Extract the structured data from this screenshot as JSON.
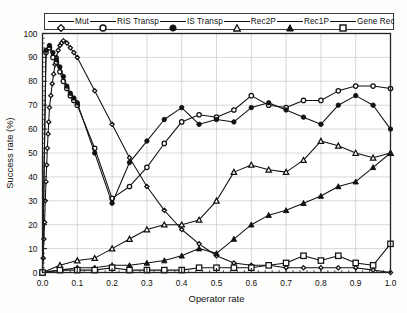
{
  "chart_data": {
    "type": "line",
    "title": "",
    "xlabel": "Operator rate",
    "ylabel": "Success rate (%)",
    "xlim": [
      0.0,
      1.0
    ],
    "ylim": [
      0,
      100
    ],
    "grid": true,
    "legend_position": "top",
    "xticks": [
      "0.0",
      "0.1",
      "0.2",
      "0.3",
      "0.4",
      "0.5",
      "0.6",
      "0.7",
      "0.8",
      "0.9",
      "1.0"
    ],
    "xtick_values": [
      0.0,
      0.1,
      0.2,
      0.3,
      0.4,
      0.5,
      0.6,
      0.7,
      0.8,
      0.9,
      1.0
    ],
    "yticks": [
      "0",
      "10",
      "20",
      "30",
      "40",
      "50",
      "60",
      "70",
      "80",
      "90",
      "100"
    ],
    "ytick_values": [
      0,
      10,
      20,
      30,
      40,
      50,
      60,
      70,
      80,
      90,
      100
    ],
    "series": [
      {
        "name": "Mut",
        "marker": "diamond-open",
        "x": [
          0.0,
          0.002,
          0.004,
          0.006,
          0.008,
          0.01,
          0.012,
          0.014,
          0.016,
          0.018,
          0.02,
          0.024,
          0.028,
          0.032,
          0.036,
          0.04,
          0.045,
          0.05,
          0.055,
          0.06,
          0.07,
          0.08,
          0.09,
          0.1,
          0.15,
          0.2,
          0.25,
          0.3,
          0.35,
          0.4,
          0.45,
          0.5,
          0.55,
          0.6,
          0.65,
          0.7,
          0.75,
          0.8,
          0.85,
          0.9,
          0.95,
          1.0
        ],
        "y": [
          0,
          6,
          14,
          21,
          30,
          38,
          45,
          52,
          58,
          63,
          69,
          74,
          79,
          83,
          87,
          90,
          93,
          95,
          96,
          97,
          96,
          94,
          92,
          90,
          76,
          62,
          48,
          36,
          26,
          18,
          12,
          7,
          4,
          3,
          3,
          2,
          2,
          2,
          2,
          2,
          1,
          0
        ]
      },
      {
        "name": "RIS Transp",
        "marker": "circle-open",
        "x": [
          0.0,
          0.01,
          0.02,
          0.03,
          0.04,
          0.05,
          0.06,
          0.07,
          0.08,
          0.09,
          0.1,
          0.15,
          0.2,
          0.25,
          0.3,
          0.35,
          0.4,
          0.45,
          0.5,
          0.55,
          0.6,
          0.65,
          0.7,
          0.75,
          0.8,
          0.85,
          0.9,
          0.95,
          1.0
        ],
        "y": [
          0,
          92,
          94,
          90,
          88,
          84,
          80,
          77,
          74,
          72,
          70,
          52,
          31,
          36,
          44,
          54,
          63,
          66,
          65,
          68,
          74,
          70,
          69,
          72,
          72,
          76,
          78,
          78,
          77
        ]
      },
      {
        "name": "IS Transp",
        "marker": "circle-filled",
        "x": [
          0.0,
          0.01,
          0.02,
          0.03,
          0.04,
          0.05,
          0.06,
          0.07,
          0.08,
          0.09,
          0.1,
          0.15,
          0.2,
          0.25,
          0.3,
          0.35,
          0.4,
          0.45,
          0.5,
          0.55,
          0.6,
          0.65,
          0.7,
          0.75,
          0.8,
          0.85,
          0.9,
          0.95,
          1.0
        ],
        "y": [
          0,
          93,
          95,
          92,
          89,
          86,
          82,
          78,
          75,
          73,
          71,
          50,
          29,
          46,
          55,
          64,
          69,
          62,
          64,
          63,
          69,
          71,
          68,
          65,
          62,
          70,
          74,
          70,
          60
        ]
      },
      {
        "name": "Rec2P",
        "marker": "triangle-open",
        "x": [
          0.0,
          0.05,
          0.1,
          0.15,
          0.2,
          0.25,
          0.3,
          0.35,
          0.4,
          0.45,
          0.5,
          0.55,
          0.6,
          0.65,
          0.7,
          0.75,
          0.8,
          0.85,
          0.9,
          0.95,
          1.0
        ],
        "y": [
          0,
          3,
          5,
          6,
          10,
          14,
          18,
          20,
          20,
          22,
          30,
          42,
          45,
          43,
          42,
          47,
          55,
          53,
          50,
          48,
          50
        ]
      },
      {
        "name": "Rec1P",
        "marker": "triangle-filled",
        "x": [
          0.0,
          0.05,
          0.1,
          0.15,
          0.2,
          0.25,
          0.3,
          0.35,
          0.4,
          0.45,
          0.5,
          0.55,
          0.6,
          0.65,
          0.7,
          0.75,
          0.8,
          0.85,
          0.9,
          0.95,
          1.0
        ],
        "y": [
          0,
          1,
          2,
          2,
          3,
          3,
          4,
          5,
          7,
          10,
          8,
          14,
          20,
          24,
          26,
          29,
          32,
          36,
          38,
          44,
          50
        ]
      },
      {
        "name": "Gene Rec",
        "marker": "square-open",
        "x": [
          0.0,
          0.05,
          0.1,
          0.15,
          0.2,
          0.25,
          0.3,
          0.35,
          0.4,
          0.45,
          0.5,
          0.55,
          0.6,
          0.65,
          0.7,
          0.75,
          0.8,
          0.85,
          0.9,
          0.95,
          1.0
        ],
        "y": [
          0,
          1,
          1,
          1,
          2,
          1,
          1,
          1,
          1,
          2,
          2,
          2,
          2,
          3,
          4,
          7,
          5,
          7,
          4,
          3,
          12
        ]
      }
    ]
  },
  "legend": {
    "entries": [
      {
        "label": "Mut",
        "marker": "diamond-open"
      },
      {
        "label": "RIS Transp",
        "marker": "circle-open"
      },
      {
        "label": "IS Transp",
        "marker": "circle-filled"
      },
      {
        "label": "Rec2P",
        "marker": "triangle-open"
      },
      {
        "label": "Rec1P",
        "marker": "triangle-filled"
      },
      {
        "label": "Gene Rec",
        "marker": "square-open"
      }
    ]
  },
  "colors": {
    "line": "#111111",
    "grid": "#c9c9c9",
    "axis": "#222222",
    "background": "#fdfdfb"
  }
}
